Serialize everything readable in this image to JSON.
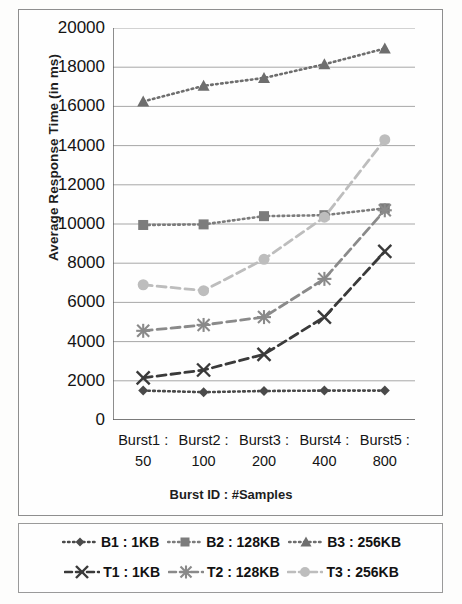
{
  "chart_data": {
    "type": "line",
    "title": "",
    "xlabel": "Burst ID : #Samples",
    "ylabel": "Average Response Time (in ms)",
    "categories": [
      "Burst1 : 50",
      "Burst2 : 100",
      "Burst3 : 200",
      "Burst4 : 400",
      "Burst5 : 800"
    ],
    "category_ids": [
      "Burst1 :",
      "Burst2 :",
      "Burst3 :",
      "Burst4 :",
      "Burst5 :"
    ],
    "category_samples": [
      "50",
      "100",
      "200",
      "400",
      "800"
    ],
    "ylim": [
      0,
      20000
    ],
    "ytick_labels": [
      "20000",
      "18000",
      "16000",
      "14000",
      "12000",
      "10000",
      "8000",
      "6000",
      "4000",
      "2000",
      "0"
    ],
    "ytick_values": [
      20000,
      18000,
      16000,
      14000,
      12000,
      10000,
      8000,
      6000,
      4000,
      2000,
      0
    ],
    "grid": true,
    "legend_position": "bottom",
    "series": [
      {
        "name": "B1 : 1KB",
        "values": [
          1500,
          1420,
          1480,
          1500,
          1500
        ],
        "color": "#4a4a4a",
        "line": "dotted",
        "marker": "diamond"
      },
      {
        "name": "B2 : 128KB",
        "values": [
          9950,
          9980,
          10400,
          10450,
          10800
        ],
        "color": "#7c7c7c",
        "line": "dotted",
        "marker": "square"
      },
      {
        "name": "B3 : 256KB",
        "values": [
          16250,
          17050,
          17450,
          18150,
          18950
        ],
        "color": "#6e6e6e",
        "line": "dotted",
        "marker": "triangle"
      },
      {
        "name": "T1 : 1KB",
        "values": [
          2150,
          2550,
          3350,
          5250,
          8600
        ],
        "color": "#3a3a3a",
        "line": "dashed",
        "marker": "cross"
      },
      {
        "name": "T2 : 128KB",
        "values": [
          4550,
          4850,
          5250,
          7200,
          10700
        ],
        "color": "#8a8a8a",
        "line": "dashed",
        "marker": "asterisk"
      },
      {
        "name": "T3 : 256KB",
        "values": [
          6900,
          6600,
          8200,
          10350,
          14300
        ],
        "color": "#bdbdbd",
        "line": "dashed",
        "marker": "circle"
      }
    ]
  },
  "legend": {
    "row1": [
      "B1 : 1KB",
      "B2 : 128KB",
      "B3 : 256KB"
    ],
    "row2": [
      "T1 : 1KB",
      "T2 : 128KB",
      "T3 : 256KB"
    ]
  },
  "axis": {
    "y_title": "Average Response Time (in ms)",
    "x_title": "Burst ID : #Samples"
  }
}
